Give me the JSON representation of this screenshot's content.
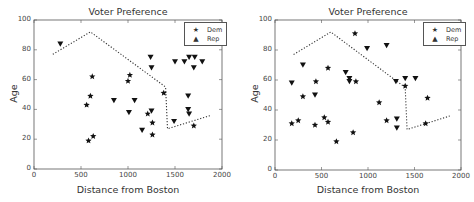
{
  "charts_meta": {
    "left": {
      "title": "Voter Preference",
      "xlabel": "Distance from Boston",
      "ylabel": "Age",
      "xticks": [
        "0",
        "500",
        "1000",
        "1500",
        "2000"
      ],
      "yticks": [
        "0",
        "20",
        "40",
        "60",
        "80",
        "100"
      ],
      "legend": [
        {
          "symbol": "★",
          "label": "Dem"
        },
        {
          "symbol": "▲",
          "label": "Rep"
        }
      ]
    },
    "right": {
      "title": "Voter Preference",
      "xlabel": "Distance from Boston",
      "ylabel": "Age",
      "xticks": [
        "0",
        "500",
        "1000",
        "1500",
        "2000"
      ],
      "yticks": [
        "0",
        "20",
        "40",
        "60",
        "80",
        "100"
      ],
      "legend": [
        {
          "symbol": "★",
          "label": "Dem"
        },
        {
          "symbol": "▲",
          "label": "Rep"
        }
      ]
    }
  },
  "chart_data": [
    {
      "type": "scatter",
      "title": "Voter Preference",
      "xlabel": "Distance from Boston",
      "ylabel": "Age",
      "xlim": [
        0,
        2000
      ],
      "ylim": [
        0,
        100
      ],
      "grid": false,
      "legend_position": "upper right",
      "series": [
        {
          "name": "Dem",
          "marker": "star",
          "points": [
            [
              560,
              43
            ],
            [
              600,
              49
            ],
            [
              580,
              19
            ],
            [
              630,
              22
            ],
            [
              620,
              62
            ],
            [
              1000,
              59
            ],
            [
              1020,
              63
            ],
            [
              1210,
              37
            ],
            [
              1260,
              31
            ],
            [
              1260,
              23
            ],
            [
              1380,
              51
            ],
            [
              1700,
              29
            ]
          ]
        },
        {
          "name": "Rep",
          "marker": "triangle_down",
          "points": [
            [
              280,
              84
            ],
            [
              850,
              46
            ],
            [
              1010,
              38
            ],
            [
              1070,
              46
            ],
            [
              1150,
              26
            ],
            [
              1240,
              75
            ],
            [
              1250,
              68
            ],
            [
              1250,
              39
            ],
            [
              1500,
              72
            ],
            [
              1600,
              72
            ],
            [
              1650,
              75
            ],
            [
              1710,
              75
            ],
            [
              1700,
              68
            ],
            [
              1790,
              72
            ],
            [
              1640,
              49
            ],
            [
              1640,
              40
            ],
            [
              1650,
              37
            ],
            [
              1490,
              32
            ]
          ]
        }
      ],
      "boundary_line": {
        "style": "dotted",
        "points": [
          [
            200,
            77
          ],
          [
            600,
            92
          ],
          [
            1400,
            55
          ],
          [
            1420,
            27
          ],
          [
            1880,
            36
          ]
        ]
      }
    },
    {
      "type": "scatter",
      "title": "Voter Preference",
      "xlabel": "Distance from Boston",
      "ylabel": "Age",
      "xlim": [
        0,
        2000
      ],
      "ylim": [
        0,
        100
      ],
      "grid": false,
      "legend_position": "upper right",
      "series": [
        {
          "name": "Dem",
          "marker": "star",
          "points": [
            [
              180,
              31
            ],
            [
              250,
              33
            ],
            [
              300,
              49
            ],
            [
              440,
              59
            ],
            [
              430,
              30
            ],
            [
              530,
              35
            ],
            [
              570,
              32
            ],
            [
              570,
              68
            ],
            [
              660,
              19
            ],
            [
              840,
              25
            ],
            [
              860,
              91
            ],
            [
              870,
              59
            ],
            [
              1120,
              45
            ],
            [
              1200,
              33
            ],
            [
              1400,
              56
            ],
            [
              1620,
              31
            ],
            [
              1640,
              48
            ]
          ]
        },
        {
          "name": "Rep",
          "marker": "triangle_down",
          "points": [
            [
              180,
              58
            ],
            [
              300,
              70
            ],
            [
              430,
              50
            ],
            [
              760,
              65
            ],
            [
              800,
              61
            ],
            [
              800,
              59
            ],
            [
              990,
              81
            ],
            [
              1200,
              83
            ],
            [
              1300,
              59
            ],
            [
              1400,
              61
            ],
            [
              1510,
              61
            ],
            [
              1310,
              34
            ],
            [
              1310,
              28
            ]
          ]
        }
      ],
      "boundary_line": {
        "style": "dotted",
        "points": [
          [
            200,
            77
          ],
          [
            600,
            92
          ],
          [
            1400,
            55
          ],
          [
            1420,
            27
          ],
          [
            1880,
            36
          ]
        ]
      }
    }
  ]
}
